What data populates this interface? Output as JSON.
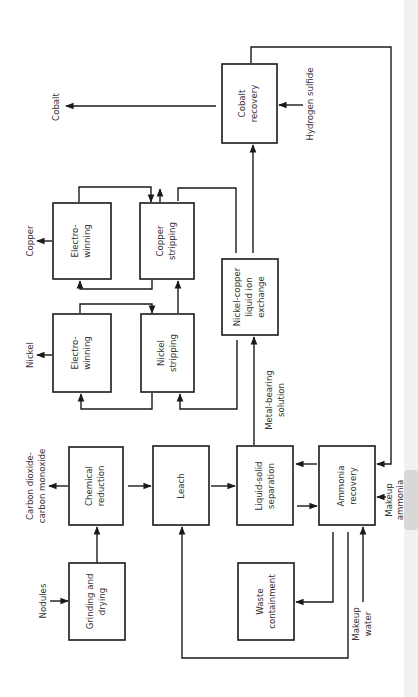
{
  "diagram": {
    "orientation": "rotated 90 degrees counter-clockwise (text reads bottom-to-top)",
    "colors": {
      "line": "#1a1a1a",
      "text": "#333333",
      "background": "#ffffff"
    },
    "nodes": {
      "grinding": {
        "line1": "Grinding and",
        "line2": "drying"
      },
      "reduction": {
        "line1": "Chemical",
        "line2": "reduction"
      },
      "leach": {
        "line1": "Leach"
      },
      "separation": {
        "line1": "Liquid-solid",
        "line2": "separation"
      },
      "ammonia": {
        "line1": "Ammonia",
        "line2": "recovery"
      },
      "waste": {
        "line1": "Waste",
        "line2": "containment"
      },
      "ion_exchange": {
        "line1": "Nickel-copper",
        "line2": "liquid ion",
        "line3": "exchange"
      },
      "nickel_stripping": {
        "line1": "Nickel",
        "line2": "stripping"
      },
      "nickel_ew": {
        "line1": "Electro-",
        "line2": "winning"
      },
      "copper_stripping": {
        "line1": "Copper",
        "line2": "stripping"
      },
      "copper_ew": {
        "line1": "Electro-",
        "line2": "winning"
      },
      "cobalt": {
        "line1": "Cobalt",
        "line2": "recovery"
      }
    },
    "streams": {
      "nodules": "Nodules",
      "co2_line1": "Carbon dioxide-",
      "co2_line2": "carbon monoxide",
      "nickel": "Nickel",
      "copper": "Copper",
      "cobalt": "Cobalt",
      "hydrogen_sulfide": "Hydrogen sulfide",
      "metal_solution_line1": "Metal-bearing",
      "metal_solution_line2": "solution",
      "makeup_water_line1": "Makeup",
      "makeup_water_line2": "water",
      "makeup_ammonia_line1": "Makeup",
      "makeup_ammonia_line2": "ammonia"
    }
  }
}
